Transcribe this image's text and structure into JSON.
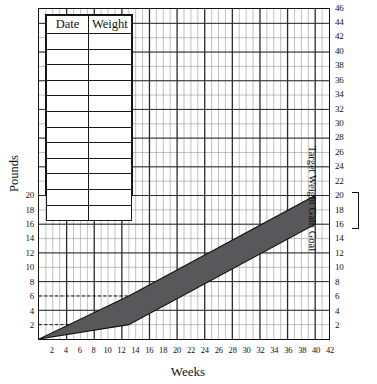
{
  "chart_data": {
    "type": "area",
    "title": "",
    "xlabel": "Weeks",
    "ylabel": "Pounds",
    "right_axis_label": "Target Weight Gain Goal",
    "xlim": [
      0,
      42
    ],
    "ylim": [
      0,
      46
    ],
    "grid": true,
    "legend": "none",
    "x_ticks": [
      2,
      4,
      6,
      8,
      10,
      12,
      14,
      16,
      18,
      20,
      22,
      24,
      26,
      28,
      30,
      32,
      34,
      36,
      38,
      40,
      42
    ],
    "y_ticks_left": [
      2,
      4,
      6,
      8,
      10,
      12,
      14,
      16,
      18,
      20
    ],
    "y_ticks_right": [
      2,
      4,
      6,
      8,
      10,
      12,
      14,
      16,
      18,
      20,
      22,
      24,
      26,
      28,
      30,
      32,
      34,
      36,
      38,
      40,
      42,
      44,
      46
    ],
    "series": [
      {
        "name": "Recommended weight gain range (upper bound)",
        "x": [
          0,
          13,
          40
        ],
        "values": [
          0,
          6,
          20
        ]
      },
      {
        "name": "Recommended weight gain range (lower bound)",
        "x": [
          0,
          13,
          40
        ],
        "values": [
          0,
          2,
          16
        ]
      }
    ],
    "band_fill_color": "#58585a",
    "annotations": [
      {
        "type": "dashed-reference-line",
        "axis": "y",
        "value": 6,
        "x_extent": [
          0,
          13
        ]
      },
      {
        "type": "dashed-reference-line",
        "axis": "y",
        "value": 2,
        "x_extent": [
          0,
          4.5
        ]
      },
      {
        "type": "bracket",
        "axis": "right",
        "from": 16,
        "to": 20,
        "label": "Target Weight Gain Goal"
      }
    ]
  },
  "axes": {
    "y_left_title": "Pounds",
    "x_title": "Weeks",
    "y_right_title": "Target Weight Gain Goal",
    "x_tick_labels": [
      "2",
      "4",
      "6",
      "8",
      "10",
      "12",
      "14",
      "16",
      "18",
      "20",
      "22",
      "24",
      "26",
      "28",
      "30",
      "32",
      "34",
      "36",
      "38",
      "40",
      "42"
    ],
    "y_left_tick_labels": [
      "2",
      "4",
      "6",
      "8",
      "10",
      "12",
      "14",
      "16",
      "18",
      "20"
    ],
    "y_right_tick_labels": [
      "2",
      "4",
      "6",
      "8",
      "10",
      "12",
      "14",
      "16",
      "18",
      "20",
      "22",
      "24",
      "26",
      "28",
      "30",
      "32",
      "34",
      "36",
      "38",
      "40",
      "42",
      "44",
      "46"
    ]
  },
  "log_table": {
    "columns": [
      "Date",
      "Weight"
    ],
    "rows": [
      [
        "",
        ""
      ],
      [
        "",
        ""
      ],
      [
        "",
        ""
      ],
      [
        "",
        ""
      ],
      [
        "",
        ""
      ],
      [
        "",
        ""
      ],
      [
        "",
        ""
      ],
      [
        "",
        ""
      ],
      [
        "",
        ""
      ],
      [
        "",
        ""
      ],
      [
        "",
        ""
      ],
      [
        "",
        ""
      ]
    ]
  },
  "colors": {
    "band": "#58585a",
    "grid_minor": "#8d8d8d",
    "grid_major": "#2a2a2a",
    "frame": "#111111",
    "background": "#ffffff"
  }
}
